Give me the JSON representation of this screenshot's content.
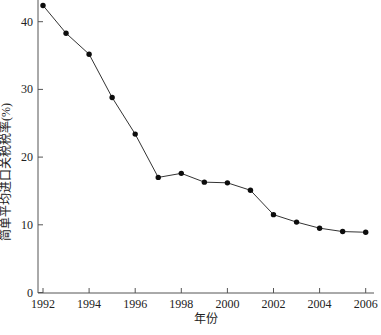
{
  "chart_data": {
    "type": "line",
    "title": "",
    "xlabel": "年份",
    "ylabel": "简单平均进口关税税率(%)",
    "x": [
      1992,
      1993,
      1994,
      1995,
      1996,
      1997,
      1998,
      1999,
      2000,
      2001,
      2002,
      2003,
      2004,
      2005,
      2006
    ],
    "values": [
      42.4,
      38.3,
      35.2,
      28.8,
      23.4,
      17.0,
      17.6,
      16.3,
      16.2,
      15.1,
      11.5,
      10.4,
      9.5,
      9.0,
      8.9
    ],
    "series_name": "简单平均进口关税税率",
    "x_ticks": [
      1992,
      1994,
      1996,
      1998,
      2000,
      2002,
      2004,
      2006
    ],
    "y_ticks": [
      0,
      10,
      20,
      30,
      40
    ],
    "xlim": [
      1991.8,
      2006.4
    ],
    "ylim": [
      0,
      43.5
    ],
    "grid": false,
    "legend_position": "none",
    "marker": "filled-circle",
    "colors": {
      "line": "#333333",
      "marker": "#0d0d0d",
      "axis": "#555555",
      "text": "#222222",
      "background": "#ffffff"
    }
  }
}
